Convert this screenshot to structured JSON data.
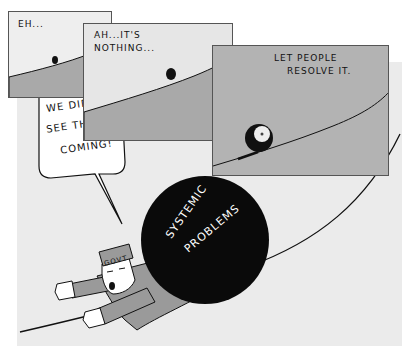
{
  "comic": {
    "top_caption": "",
    "colors": {
      "background": "#ffffff",
      "big_panel": "#ebebeb",
      "sky_light": "#e6e6e6",
      "hill_gray": "#a9a9a9",
      "panel3_fill": "#b3b3b3",
      "ball": "#0a0a0a",
      "outline": "#111111"
    },
    "panels": [
      {
        "id": 1,
        "caption": "EH..."
      },
      {
        "id": 2,
        "caption_line1": "AH...IT'S",
        "caption_line2": "NOTHING..."
      },
      {
        "id": 3,
        "caption_line1": "LET PEOPLE",
        "caption_line2": "RESOLVE IT."
      }
    ],
    "main_scene": {
      "speech_line1": "WE DID NOT",
      "speech_line2": "SEE THIS",
      "speech_line3": "COMING!",
      "ball_label_line1": "SYSTEMIC",
      "ball_label_line2": "PROBLEMS",
      "hat_label": "GOVT"
    }
  }
}
